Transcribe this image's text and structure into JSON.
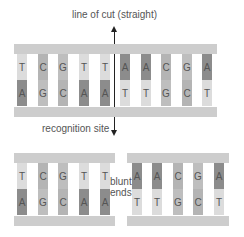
{
  "labels": {
    "cut_line": "line of cut (straight)",
    "recognition_site": "recognition site",
    "blunt": "blunt",
    "ends": "ends"
  },
  "colors": {
    "A": "#8c8c8c",
    "T": "#dcdcdc",
    "C": "#b4b4b4",
    "G": "#bebebe",
    "backbone": "#cdcdcd"
  },
  "intact_duplex": {
    "top_strand": [
      "T",
      "C",
      "G",
      "T",
      "T",
      "A",
      "A",
      "C",
      "G",
      "A"
    ],
    "bottom_strand": [
      "A",
      "G",
      "C",
      "A",
      "A",
      "T",
      "T",
      "G",
      "C",
      "T"
    ]
  },
  "left_fragment": {
    "top_strand": [
      "T",
      "C",
      "G",
      "T",
      "T"
    ],
    "bottom_strand": [
      "A",
      "G",
      "C",
      "A",
      "A"
    ]
  },
  "right_fragment": {
    "top_strand": [
      "A",
      "A",
      "C",
      "G",
      "A"
    ],
    "bottom_strand": [
      "T",
      "T",
      "G",
      "C",
      "T"
    ]
  }
}
